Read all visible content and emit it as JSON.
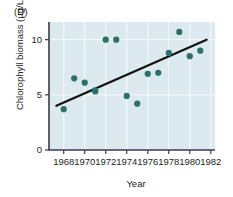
{
  "panel": {
    "label": "(D)"
  },
  "chart_data": {
    "type": "scatter",
    "title": "",
    "subtitle": "",
    "xlabel": "Year",
    "ylabel": "Chlorophyll biomass (µg/L)",
    "xlim": [
      1966.6,
      1982.4
    ],
    "ylim": [
      0,
      11.6
    ],
    "xticks": [
      1968,
      1970,
      1972,
      1974,
      1976,
      1978,
      1980,
      1982
    ],
    "xtick_labels": [
      "1968",
      "1970",
      "1972",
      "1974",
      "1976",
      "1978",
      "1980",
      "1982"
    ],
    "yticks": [
      0,
      5,
      10
    ],
    "ytick_labels": [
      "0",
      "5",
      "10"
    ],
    "grid": true,
    "legend": "none",
    "series": [
      {
        "name": "Chlorophyll biomass",
        "type": "scatter",
        "marker": "circle",
        "color": "#2d7068",
        "x": [
          1968,
          1969,
          1970,
          1971,
          1971,
          1972,
          1973,
          1974,
          1975,
          1976,
          1977,
          1978,
          1979,
          1980,
          1981
        ],
        "y": [
          3.7,
          6.5,
          6.1,
          5.4,
          5.3,
          10.0,
          10.0,
          4.9,
          4.2,
          6.9,
          7.0,
          8.8,
          10.7,
          8.5,
          9.0
        ]
      },
      {
        "name": "Linear trend",
        "type": "line",
        "color": "#111111",
        "x": [
          1967.3,
          1981.6
        ],
        "y": [
          4.0,
          10.0
        ]
      }
    ],
    "plot_background": "#dce9ee",
    "gridline_color": "#ffffff",
    "axis_color": "#3b3b4a"
  }
}
